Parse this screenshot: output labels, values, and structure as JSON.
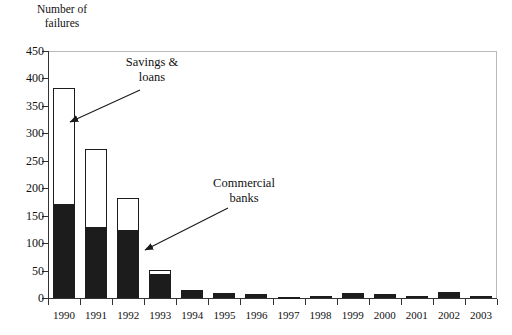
{
  "axis_title": "Number of\nfailures",
  "annotations": {
    "savings_loans": "Savings &\nloans",
    "commercial_banks": "Commercial\nbanks"
  },
  "colors": {
    "commercial_banks": "#1c1c1c",
    "savings_loans": "#ffffff",
    "axis": "#333333",
    "frame": "#b9b9b9",
    "text": "#111111"
  },
  "chart_data": {
    "type": "bar",
    "stacked": true,
    "title": "",
    "subtitle": "",
    "xlabel": "",
    "ylabel": "Number of failures",
    "ylim": [
      0,
      450
    ],
    "ytick_step": 50,
    "grid": false,
    "legend": "annotations",
    "categories": [
      "1990",
      "1991",
      "1992",
      "1993",
      "1994",
      "1995",
      "1996",
      "1997",
      "1998",
      "1999",
      "2000",
      "2001",
      "2002",
      "2003"
    ],
    "ticklabels_y": [
      "0",
      "50",
      "100",
      "150",
      "200",
      "250",
      "300",
      "350",
      "400",
      "450"
    ],
    "series": [
      {
        "name": "Commercial banks",
        "color": "#1c1c1c",
        "values": [
          169,
          127,
          122,
          42,
          13,
          8,
          6,
          1,
          3,
          8,
          7,
          4,
          11,
          3
        ]
      },
      {
        "name": "Savings & loans",
        "color": "#ffffff",
        "values": [
          213,
          144,
          60,
          9,
          2,
          2,
          1,
          0,
          0,
          1,
          1,
          0,
          0,
          0
        ]
      }
    ],
    "totals": [
      382,
      271,
      182,
      51,
      15,
      10,
      7,
      1,
      3,
      9,
      8,
      4,
      11,
      3
    ]
  }
}
